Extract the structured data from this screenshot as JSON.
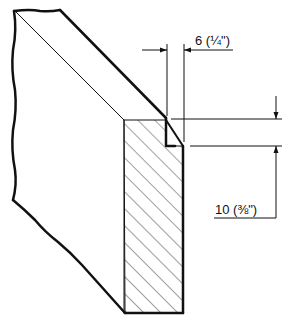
{
  "diagram": {
    "type": "technical-drawing",
    "dimensions": [
      {
        "id": "rebate-width",
        "label": "6 (1/4\")",
        "value_mm": 6,
        "value_in": "1/4"
      },
      {
        "id": "rebate-depth",
        "label": "10 (3/8\")",
        "value_mm": 10,
        "value_in": "3/8"
      }
    ],
    "colors": {
      "ink": "#111111",
      "paper": "#ffffff"
    }
  }
}
